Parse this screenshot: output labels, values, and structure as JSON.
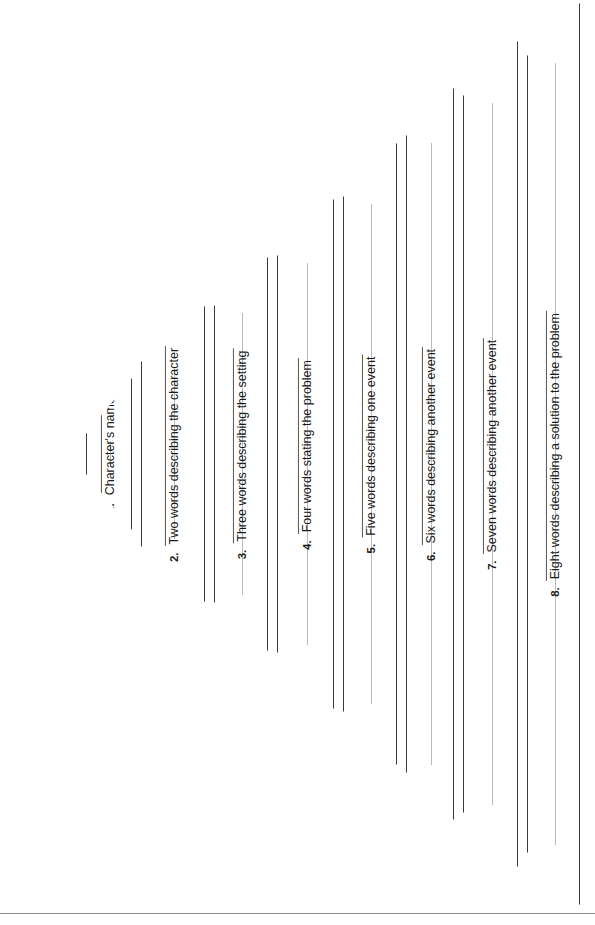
{
  "worksheet": {
    "title": "Story Pyramid",
    "shape": "triangle",
    "orientation": "rotated-90-apex-left",
    "apex": {
      "x": 32,
      "y": 453
    },
    "top_right": {
      "x": 580,
      "y": 3
    },
    "bottom_right": {
      "x": 580,
      "y": 905
    },
    "footer_rule_y": 913,
    "colors": {
      "ink": "#1a1a1a",
      "outline": "#3a3a3a",
      "rule": "#555555",
      "write_line": "#b9b9b9",
      "page": "#ffffff",
      "foot_rule": "#8c8c8c"
    }
  },
  "rows": [
    {
      "number": "1.",
      "label": "Character's name",
      "left": 86,
      "width": 46,
      "top": 378,
      "height": 152,
      "slant": 56,
      "write_line_offset": 0.5
    },
    {
      "number": "2.",
      "label": "Two words describing the character",
      "left": 141,
      "width": 64,
      "top": 306,
      "height": 296,
      "slant": 56,
      "write_line_offset": 0.5
    },
    {
      "number": "3.",
      "label": "Three words describing the setting",
      "left": 214,
      "width": 54,
      "top": 257,
      "height": 394,
      "slant": 49,
      "write_line_offset": 0.5
    },
    {
      "number": "4.",
      "label": "Four words stating the problem",
      "left": 277,
      "width": 57,
      "top": 199,
      "height": 510,
      "slant": 57,
      "write_line_offset": 0.5
    },
    {
      "number": "5.",
      "label": "Five words describing one event",
      "left": 343,
      "width": 54,
      "top": 143,
      "height": 622,
      "slant": 54,
      "write_line_offset": 0.5
    },
    {
      "number": "6.",
      "label": "Six words describing another event",
      "left": 406,
      "width": 48,
      "top": 88,
      "height": 732,
      "slant": 48,
      "write_line_offset": 0.5
    },
    {
      "number": "7.",
      "label": "Seven words describing another event",
      "left": 463,
      "width": 55,
      "top": 41,
      "height": 826,
      "slant": 55,
      "write_line_offset": 0.5
    },
    {
      "number": "8.",
      "label": "Eight words describing a solution to the problem",
      "left": 527,
      "width": 53,
      "top": 3,
      "height": 902,
      "slant": 53,
      "write_line_offset": 0.5
    }
  ]
}
